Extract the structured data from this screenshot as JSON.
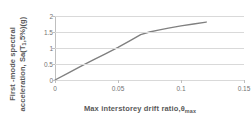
{
  "chart_data": {
    "type": "line",
    "title": "",
    "xlabel": "Max interstorey drift ratio,θmax",
    "xlabel_main": "Max interstorey drift ratio,θ",
    "xlabel_sub": "max",
    "ylabel": "First -mode spectral acceleration, Sa(T1,5%)(g)",
    "ylabel_line1": "First -mode spectral",
    "ylabel_line2_a": "acceleration, Sa(T",
    "ylabel_line2_sub": "1",
    "ylabel_line2_b": ",5%)(g)",
    "xlim": [
      0,
      0.15
    ],
    "ylim": [
      0,
      2
    ],
    "xticks": [
      "0",
      "0.05",
      "0.1",
      "0.15"
    ],
    "xtick_values": [
      0,
      0.05,
      0.1,
      0.15
    ],
    "yticks": [
      "0",
      "0.5",
      "1",
      "1.5",
      "2"
    ],
    "ytick_values": [
      0,
      0.5,
      1,
      1.5,
      2
    ],
    "grid": "horizontal",
    "legend": "none",
    "series": [
      {
        "name": "IDA curve",
        "color": "#808080",
        "line_width": 1.4,
        "x": [
          0,
          0.01,
          0.02,
          0.03,
          0.04,
          0.05,
          0.06,
          0.068,
          0.075,
          0.082,
          0.09,
          0.1,
          0.11,
          0.12
        ],
        "y": [
          0,
          0.21,
          0.42,
          0.62,
          0.82,
          1.02,
          1.24,
          1.42,
          1.5,
          1.56,
          1.62,
          1.69,
          1.75,
          1.81
        ]
      }
    ],
    "colors": {
      "series": "#808080",
      "gridline": "#d9d9d9",
      "axis": "#bfbfbf",
      "tick_text": "#737373",
      "title_text": "#595959",
      "background": "#ffffff"
    }
  }
}
